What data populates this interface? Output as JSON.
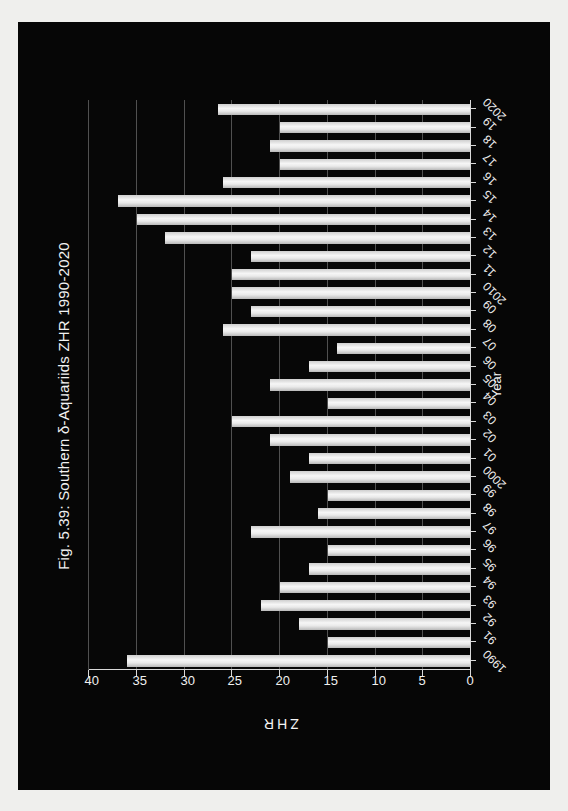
{
  "figure": {
    "title": "Fig. 5.39: Southern δ-Aquariids ZHR 1990-2020",
    "background_color": "#060606",
    "bar_color": "#eaeaea",
    "grid_color": "#6a6a6a",
    "axis_color": "#d8d8d8"
  },
  "chart_data": {
    "type": "bar",
    "title": "Fig. 5.39: Southern δ-Aquariids ZHR 1990-2020",
    "orientation": "horizontal-rotated",
    "xlabel": "Year",
    "ylabel": "ZHR",
    "ylim": [
      0,
      40
    ],
    "yticks": [
      0,
      5,
      10,
      15,
      20,
      25,
      30,
      35,
      40
    ],
    "grid": true,
    "legend": "none",
    "categories": [
      "1990",
      "91",
      "92",
      "93",
      "94",
      "95",
      "96",
      "97",
      "98",
      "99",
      "2000",
      "01",
      "02",
      "03",
      "04",
      "05",
      "06",
      "07",
      "08",
      "09",
      "2010",
      "11",
      "12",
      "13",
      "14",
      "15",
      "16",
      "17",
      "18",
      "19",
      "2020"
    ],
    "values": [
      36,
      15,
      18,
      22,
      20,
      17,
      15,
      23,
      16,
      15,
      19,
      17,
      21,
      25,
      15,
      21,
      17,
      14,
      26,
      23,
      25,
      25,
      23,
      32,
      35,
      37,
      26,
      20,
      21,
      20,
      26.5
    ]
  }
}
